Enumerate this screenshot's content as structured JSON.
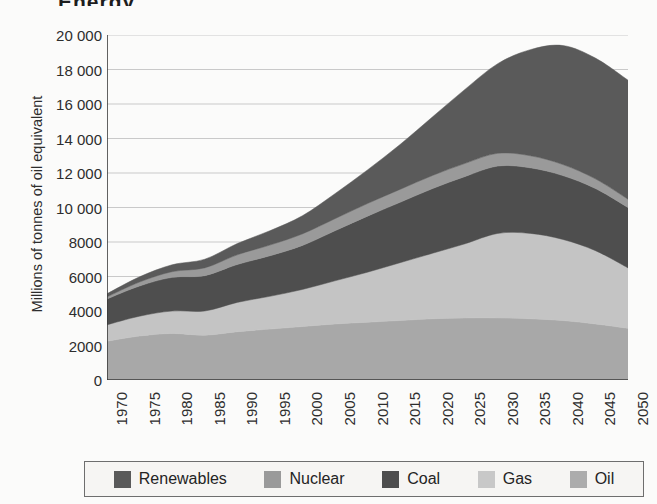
{
  "figure": {
    "title_crop": "Energy",
    "background_color": "#fbfbfa"
  },
  "chart_data": {
    "type": "area",
    "stacked": true,
    "title": "",
    "xlabel": "",
    "ylabel": "Millions of tonnes of oil equivalent",
    "x": [
      1970,
      1975,
      1980,
      1985,
      1990,
      1995,
      2000,
      2005,
      2010,
      2015,
      2020,
      2025,
      2030,
      2035,
      2040,
      2045,
      2050
    ],
    "xlim": [
      1970,
      2050
    ],
    "ylim": [
      0,
      20000
    ],
    "yticks": [
      0,
      2000,
      4000,
      6000,
      8000,
      10000,
      12000,
      14000,
      16000,
      18000,
      20000
    ],
    "ytick_labels": [
      "0",
      "2000",
      "4000",
      "6000",
      "8000",
      "10 000",
      "12 000",
      "14 000",
      "16 000",
      "18 000",
      "20 000"
    ],
    "xtick_labels": [
      "1970",
      "1975",
      "1980",
      "1985",
      "1990",
      "1995",
      "2000",
      "2005",
      "2010",
      "2015",
      "2020",
      "2025",
      "2030",
      "2035",
      "2040",
      "2045",
      "2050"
    ],
    "grid": true,
    "grid_axis": "y",
    "legend_position": "bottom",
    "stack_order_bottom_to_top": [
      "Oil",
      "Gas",
      "Coal",
      "Nuclear",
      "Renewables"
    ],
    "series": [
      {
        "name": "Oil",
        "color": "#a8a8a8",
        "values": [
          2250,
          2550,
          2700,
          2600,
          2800,
          2950,
          3100,
          3250,
          3350,
          3450,
          3550,
          3600,
          3600,
          3550,
          3450,
          3250,
          3000
        ]
      },
      {
        "name": "Gas",
        "color": "#c4c4c4",
        "values": [
          950,
          1150,
          1300,
          1400,
          1700,
          1900,
          2150,
          2500,
          2900,
          3350,
          3800,
          4300,
          4900,
          4950,
          4700,
          4250,
          3500
        ]
      },
      {
        "name": "Coal",
        "color": "#4e4e4e",
        "values": [
          1500,
          1750,
          1950,
          2050,
          2200,
          2350,
          2550,
          2900,
          3250,
          3500,
          3750,
          3900,
          3900,
          3800,
          3700,
          3600,
          3500
        ]
      },
      {
        "name": "Nuclear",
        "color": "#9a9a9a",
        "values": [
          120,
          230,
          330,
          450,
          560,
          620,
          670,
          700,
          730,
          750,
          760,
          760,
          740,
          700,
          640,
          560,
          480
        ]
      },
      {
        "name": "Renewables",
        "color": "#5a5a5a",
        "values": [
          180,
          300,
          400,
          500,
          650,
          830,
          1050,
          1450,
          1950,
          2600,
          3400,
          4300,
          5200,
          6150,
          6900,
          7000,
          6900
        ]
      }
    ],
    "totals": [
      5000,
      5980,
      6680,
      7000,
      7910,
      8650,
      9520,
      10800,
      12180,
      13650,
      15260,
      16860,
      18340,
      19150,
      19390,
      18660,
      17380
    ]
  },
  "legend": {
    "items": [
      {
        "label": "Renewables",
        "color": "#5a5a5a"
      },
      {
        "label": "Nuclear",
        "color": "#9a9a9a"
      },
      {
        "label": "Coal",
        "color": "#4e4e4e"
      },
      {
        "label": "Gas",
        "color": "#c8c8c8"
      },
      {
        "label": "Oil",
        "color": "#acacac"
      }
    ]
  }
}
